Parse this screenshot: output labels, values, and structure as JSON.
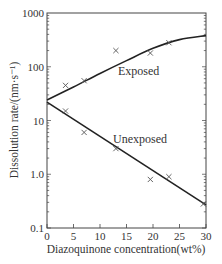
{
  "chart_data": {
    "type": "scatter",
    "title": "",
    "xlabel": "Diazoquinone concentration(wt%)",
    "ylabel": "Dissolution rate/(nm·s⁻¹)",
    "xlim": [
      0,
      30
    ],
    "ylim": [
      0.1,
      1000
    ],
    "yscale": "log",
    "x_ticks": [
      "0",
      "5",
      "10",
      "15",
      "20",
      "25",
      "30"
    ],
    "y_ticks": [
      "0.1",
      "1.0",
      "10",
      "100",
      "1000"
    ],
    "grid": false,
    "series": [
      {
        "name": "Exposed",
        "marker": "x",
        "points": [
          [
            3.5,
            45
          ],
          [
            7,
            55
          ],
          [
            13,
            200
          ],
          [
            19.5,
            180
          ],
          [
            23,
            280
          ]
        ],
        "fit_curve": [
          [
            0,
            24
          ],
          [
            5,
            42
          ],
          [
            10,
            75
          ],
          [
            15,
            130
          ],
          [
            20,
            220
          ],
          [
            25,
            320
          ],
          [
            30,
            380
          ]
        ]
      },
      {
        "name": "Unexposed",
        "marker": "x",
        "points": [
          [
            3.5,
            15
          ],
          [
            7,
            6
          ],
          [
            13,
            3
          ],
          [
            19.5,
            0.8
          ],
          [
            23,
            0.9
          ],
          [
            29.5,
            0.28
          ]
        ],
        "fit_curve": [
          [
            0,
            22
          ],
          [
            30,
            0.27
          ]
        ]
      }
    ],
    "annotations": [
      "Exposed",
      "Unexposed"
    ]
  }
}
